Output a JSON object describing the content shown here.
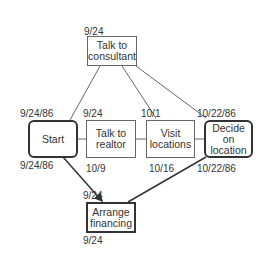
{
  "diagram": {
    "type": "PERT network",
    "nodes": [
      {
        "id": "consultant",
        "label": "Talk to consultant",
        "line1": "Talk to",
        "line2": "consultant",
        "date_top": "9/24"
      },
      {
        "id": "start",
        "label": "Start",
        "line1": "Start",
        "date_top": "9/24/86",
        "date_bottom": "9/24/86"
      },
      {
        "id": "realtor",
        "label": "Talk to realtor",
        "line1": "Talk to",
        "line2": "realtor",
        "date_top": "9/24",
        "date_bottom": "10/9"
      },
      {
        "id": "visit",
        "label": "Visit locations",
        "line1": "Visit",
        "line2": "locations",
        "date_top": "10/1",
        "date_bottom": "10/16"
      },
      {
        "id": "decide",
        "label": "Decide on location",
        "line1": "Decide on",
        "line2": "location",
        "date_top": "10/22/86",
        "date_bottom": "10/22/86"
      },
      {
        "id": "financing",
        "label": "Arrange financing",
        "line1": "Arrange",
        "line2": "financing",
        "date_top": "9/24",
        "date_bottom": "9/24"
      }
    ],
    "edges": [
      {
        "from": "start",
        "to": "consultant"
      },
      {
        "from": "consultant",
        "to": "visit"
      },
      {
        "from": "consultant",
        "to": "decide"
      },
      {
        "from": "start",
        "to": "realtor"
      },
      {
        "from": "realtor",
        "to": "visit"
      },
      {
        "from": "visit",
        "to": "decide"
      },
      {
        "from": "start",
        "to": "financing",
        "arrow": true
      },
      {
        "from": "decide",
        "to": "financing",
        "arrow": true
      }
    ]
  }
}
